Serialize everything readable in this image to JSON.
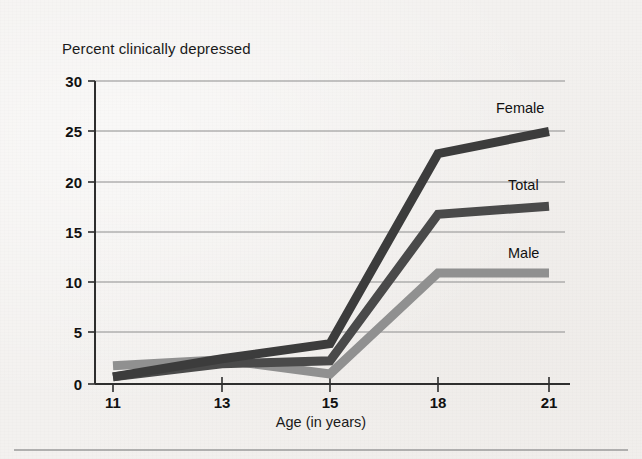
{
  "figure": {
    "title": "Percent clinically depressed",
    "xlabel": "Age (in years)",
    "background_color": "#f3f1ef"
  },
  "axis": {
    "y_ticks": [
      "0",
      "5",
      "10",
      "15",
      "20",
      "25",
      "30"
    ],
    "x_ticks": [
      "11",
      "13",
      "15",
      "18",
      "21"
    ]
  },
  "series_labels": {
    "female": "Female",
    "total": "Total",
    "male": "Male"
  },
  "colors": {
    "female": "#3c3c3c",
    "total": "#4a4a4a",
    "male": "#909090",
    "gridline": "#8d8d8d",
    "axis": "#3a3a3a"
  },
  "chart_data": {
    "type": "line",
    "title": "Percent clinically depressed",
    "xlabel": "Age (in years)",
    "ylabel": "Percent clinically depressed",
    "categories": [
      "11",
      "13",
      "15",
      "18",
      "21"
    ],
    "x": [
      11,
      13,
      15,
      18,
      21
    ],
    "ylim": [
      0,
      30
    ],
    "yticks": [
      0,
      5,
      10,
      15,
      20,
      25,
      30
    ],
    "grid": true,
    "legend": "inline-right-of-line-end",
    "series": [
      {
        "name": "Female",
        "color": "#3c3c3c",
        "values": [
          0.7,
          2.5,
          4.0,
          22.8,
          25.0
        ],
        "label_position": "above-right"
      },
      {
        "name": "Total",
        "color": "#4a4a4a",
        "values": [
          0.7,
          2.0,
          2.3,
          16.8,
          17.6
        ],
        "label_position": "above-right"
      },
      {
        "name": "Male",
        "color": "#909090",
        "values": [
          1.8,
          2.4,
          1.0,
          11.0,
          11.0
        ],
        "label_position": "above-right"
      }
    ]
  }
}
